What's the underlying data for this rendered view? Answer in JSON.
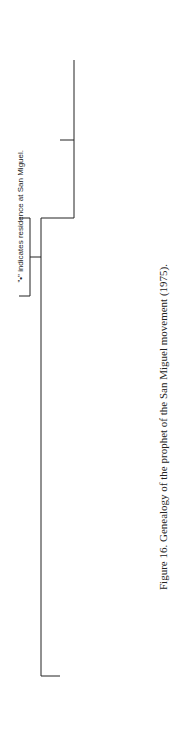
{
  "legend": "\"•\" indicates residence at San Miguel.",
  "caption": "Figure 16.  Genealogy of the prophet of the San Miguel movement (1975).",
  "labels": {
    "prophet": "Prophet",
    "prophets_aide": "Prophet's Aide"
  },
  "symbols": {
    "triangle": "male",
    "circle": "female",
    "filled": "deceased",
    "dot": "resides at San Miguel"
  },
  "colors": {
    "ink": "#222222",
    "background": "#ffffff"
  }
}
